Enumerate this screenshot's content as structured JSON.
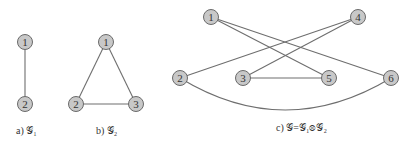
{
  "graphs": [
    {
      "id": "g1",
      "caption": "a) 𝒢₁",
      "nodes": [
        {
          "label": "1",
          "x": 25,
          "y": 42
        },
        {
          "label": "2",
          "x": 25,
          "y": 104
        }
      ],
      "edges": [
        [
          "1",
          "2"
        ]
      ]
    },
    {
      "id": "g2",
      "caption": "b) 𝒢₂",
      "nodes": [
        {
          "label": "1",
          "x": 106,
          "y": 42
        },
        {
          "label": "2",
          "x": 76,
          "y": 104
        },
        {
          "label": "3",
          "x": 136,
          "y": 104
        }
      ],
      "edges": [
        [
          "1",
          "2"
        ],
        [
          "1",
          "3"
        ],
        [
          "2",
          "3"
        ]
      ]
    },
    {
      "id": "g",
      "caption": "c) 𝒢=𝒢₁⊗𝒢₂",
      "nodes": [
        {
          "label": "1",
          "x": 211,
          "y": 17
        },
        {
          "label": "4",
          "x": 358,
          "y": 17
        },
        {
          "label": "2",
          "x": 180,
          "y": 78
        },
        {
          "label": "3",
          "x": 243,
          "y": 78
        },
        {
          "label": "5",
          "x": 329,
          "y": 78
        },
        {
          "label": "6",
          "x": 391,
          "y": 78
        }
      ],
      "edges": [
        [
          "1",
          "5"
        ],
        [
          "1",
          "6"
        ],
        [
          "4",
          "2"
        ],
        [
          "4",
          "3"
        ],
        [
          "3",
          "5"
        ],
        [
          "2",
          "6",
          "curved"
        ]
      ]
    }
  ],
  "captions": {
    "a": "a) 𝒢₁",
    "b": "b) 𝒢₂",
    "c": "c) 𝒢=𝒢₁⊗𝒢₂"
  }
}
